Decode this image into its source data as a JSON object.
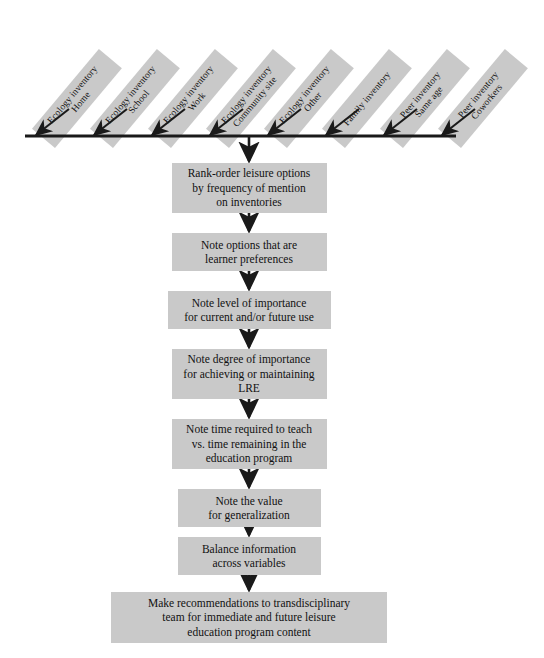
{
  "diagram": {
    "box_fill": "#c9c9c9",
    "line_color": "#1a1a1a",
    "background": "#ffffff",
    "inventories": [
      {
        "line1": "Ecology inventory",
        "line2": "Home"
      },
      {
        "line1": "Ecology inventory",
        "line2": "School"
      },
      {
        "line1": "Ecology inventory",
        "line2": "Work"
      },
      {
        "line1": "Ecology inventory",
        "line2": "Community site"
      },
      {
        "line1": "Ecology inventory",
        "line2": "Other"
      },
      {
        "line1": "Family inventory",
        "line2": ""
      },
      {
        "line1": "Peer inventory",
        "line2": "Same age"
      },
      {
        "line1": "Peer inventory",
        "line2": "Coworkers"
      }
    ],
    "steps": [
      {
        "lines": [
          "Rank-order leisure options",
          "by frequency of mention",
          "on inventories"
        ]
      },
      {
        "lines": [
          "Note options that are",
          "learner preferences"
        ]
      },
      {
        "lines": [
          "Note level of importance",
          "for current and/or future use"
        ]
      },
      {
        "lines": [
          "Note degree of importance",
          "for achieving or maintaining",
          "LRE"
        ]
      },
      {
        "lines": [
          "Note time required to teach",
          "vs. time remaining in the",
          "education program"
        ]
      },
      {
        "lines": [
          "Note the value",
          "for generalization"
        ]
      },
      {
        "lines": [
          "Balance information",
          "across variables"
        ]
      },
      {
        "lines": [
          "Make recommendations to transdisciplinary",
          "team for immediate and future leisure",
          "education program content"
        ]
      }
    ]
  }
}
